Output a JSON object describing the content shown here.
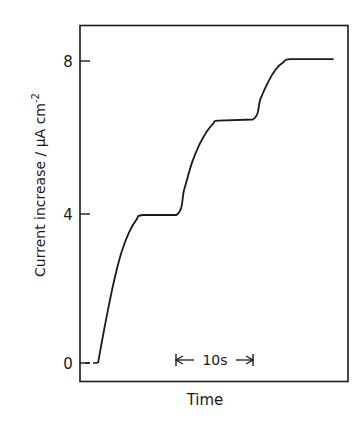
{
  "chart_data": {
    "type": "line",
    "title": "",
    "xlabel": "Time",
    "ylabel": "Current increase / μA cm⁻²",
    "ylabel_parts": {
      "main": "Current increase / μA cm",
      "sup": "-2"
    },
    "y_ticks": [
      0,
      4,
      8
    ],
    "ylim": [
      -0.5,
      9.1
    ],
    "x_ticks": [],
    "xlim_seconds": [
      -3,
      32
    ],
    "grid": false,
    "legend": null,
    "scale_bar": {
      "label": "10s",
      "duration_s": 10,
      "start_s": 10.2,
      "end_s": 20.2
    },
    "series": [
      {
        "name": "current",
        "style": "solid",
        "points": [
          {
            "t": 0.0,
            "y": 0.0
          },
          {
            "t": 1.0,
            "y": 1.1
          },
          {
            "t": 2.0,
            "y": 2.1
          },
          {
            "t": 3.0,
            "y": 2.9
          },
          {
            "t": 4.0,
            "y": 3.45
          },
          {
            "t": 5.0,
            "y": 3.8
          },
          {
            "t": 5.8,
            "y": 3.92
          },
          {
            "t": 10.2,
            "y": 3.92
          },
          {
            "t": 11.2,
            "y": 4.6
          },
          {
            "t": 12.2,
            "y": 5.3
          },
          {
            "t": 13.2,
            "y": 5.8
          },
          {
            "t": 14.2,
            "y": 6.15
          },
          {
            "t": 15.0,
            "y": 6.35
          },
          {
            "t": 15.6,
            "y": 6.42
          },
          {
            "t": 20.1,
            "y": 6.45
          },
          {
            "t": 21.1,
            "y": 7.0
          },
          {
            "t": 22.1,
            "y": 7.45
          },
          {
            "t": 23.1,
            "y": 7.78
          },
          {
            "t": 24.1,
            "y": 7.97
          },
          {
            "t": 25.0,
            "y": 8.05
          },
          {
            "t": 30.6,
            "y": 8.05
          }
        ]
      },
      {
        "name": "baseline",
        "style": "dashed",
        "points": [
          {
            "t": -1.7,
            "y": 0.0
          },
          {
            "t": 0.0,
            "y": 0.0
          }
        ]
      }
    ]
  },
  "labels": {
    "tick_0": "0",
    "tick_4": "4",
    "tick_8": "8",
    "x_axis": "Time",
    "scale_bar": "10s",
    "y_axis_main": "Current increase / μA cm",
    "y_axis_sup": "-2"
  },
  "colors": {
    "ink": "#1a1a1a",
    "background": "#ffffff"
  }
}
